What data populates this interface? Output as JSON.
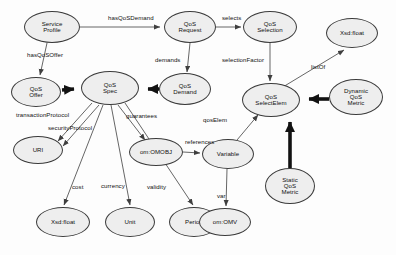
{
  "diagram": {
    "style": {
      "node_fill": "#eeeeee",
      "node_stroke": "#3a3a3a",
      "edge_color": "#555555",
      "bold_edge_color": "#111111",
      "background": "#fdfdfd"
    },
    "nodes": [
      {
        "id": "service-profile",
        "label": "Service\nProfile",
        "lines": [
          "Service",
          "Profile"
        ],
        "cx": 52,
        "cy": 27,
        "rx": 28,
        "ry": 16
      },
      {
        "id": "qos-request",
        "label": "QoS\nRequest",
        "lines": [
          "QoS",
          "Request"
        ],
        "cx": 190,
        "cy": 27,
        "rx": 26,
        "ry": 16
      },
      {
        "id": "qos-selection",
        "label": "QoS\nSelection",
        "lines": [
          "QoS",
          "Selection"
        ],
        "cx": 270,
        "cy": 27,
        "rx": 27,
        "ry": 16
      },
      {
        "id": "xsd-float-top",
        "label": "Xsd:float",
        "lines": [
          "Xsd:float"
        ],
        "cx": 352,
        "cy": 33,
        "rx": 26,
        "ry": 15
      },
      {
        "id": "qos-offer",
        "label": "QoS\nOffer",
        "lines": [
          "QoS",
          "Offer"
        ],
        "cx": 36,
        "cy": 92,
        "rx": 25,
        "ry": 15
      },
      {
        "id": "qos-spec",
        "label": "QoS\nSpec",
        "lines": [
          "QoS",
          "Spec"
        ],
        "cx": 110,
        "cy": 88,
        "rx": 29,
        "ry": 17
      },
      {
        "id": "qos-demand",
        "label": "QoS\nDemand",
        "lines": [
          "QoS",
          "Demand"
        ],
        "cx": 185,
        "cy": 89,
        "rx": 26,
        "ry": 16
      },
      {
        "id": "qos-selectelem",
        "label": "QoS\nSelectElem",
        "lines": [
          "QoS",
          "SelectElem"
        ],
        "cx": 271,
        "cy": 100,
        "rx": 29,
        "ry": 17
      },
      {
        "id": "dynamic-qos-metric",
        "label": "Dynamic\nQoS\nMetric",
        "lines": [
          "Dynamic",
          "QoS",
          "Metric"
        ],
        "cx": 356,
        "cy": 97,
        "rx": 27,
        "ry": 18
      },
      {
        "id": "uri",
        "label": "URI",
        "lines": [
          "URI"
        ],
        "cx": 38,
        "cy": 150,
        "rx": 25,
        "ry": 14
      },
      {
        "id": "om-omobj",
        "label": "om:OMOBJ",
        "lines": [
          "om:OMOBJ"
        ],
        "cx": 156,
        "cy": 152,
        "rx": 27,
        "ry": 14
      },
      {
        "id": "variable",
        "label": "Variable",
        "lines": [
          "Variable"
        ],
        "cx": 228,
        "cy": 154,
        "rx": 26,
        "ry": 15
      },
      {
        "id": "static-qos-metric",
        "label": "Static\nQoS\nMetric",
        "lines": [
          "Static",
          "QoS",
          "Metric"
        ],
        "cx": 290,
        "cy": 186,
        "rx": 25,
        "ry": 18
      },
      {
        "id": "xsd-float-bottom",
        "label": "Xsd:float",
        "lines": [
          "Xsd:float"
        ],
        "cx": 63,
        "cy": 222,
        "rx": 27,
        "ry": 15
      },
      {
        "id": "unit",
        "label": "Unit",
        "lines": [
          "Unit"
        ],
        "cx": 130,
        "cy": 222,
        "rx": 25,
        "ry": 15
      },
      {
        "id": "period",
        "label": "Period",
        "lines": [
          "Period"
        ],
        "cx": 194,
        "cy": 222,
        "rx": 25,
        "ry": 15
      },
      {
        "id": "om-omv",
        "label": "om:OMV",
        "lines": [
          "om:OMV"
        ],
        "cx": 225,
        "cy": 222,
        "rx": 26,
        "ry": 14
      }
    ],
    "edges": [
      {
        "id": "e-hasqosdemand",
        "from": "service-profile",
        "to": "qos-request",
        "label": "hasQoSDemand",
        "bold": false
      },
      {
        "id": "e-selects",
        "from": "qos-request",
        "to": "qos-selection",
        "label": "selects",
        "bold": false
      },
      {
        "id": "e-hasqosoffer",
        "from": "service-profile",
        "to": "qos-offer",
        "label": "hasQoSOffer",
        "bold": false
      },
      {
        "id": "e-demands",
        "from": "qos-request",
        "to": "qos-demand",
        "label": "demands",
        "bold": false
      },
      {
        "id": "e-offer-spec",
        "from": "qos-offer",
        "to": "qos-spec",
        "label": "",
        "bold": true
      },
      {
        "id": "e-demand-spec",
        "from": "qos-demand",
        "to": "qos-spec",
        "label": "",
        "bold": true
      },
      {
        "id": "e-selectionfactor",
        "from": "qos-selection",
        "to": "qos-selectelem",
        "label": "selectionFactor",
        "bold": false
      },
      {
        "id": "e-listof",
        "from": "qos-selectelem",
        "to": "xsd-float-top",
        "label": "listOf",
        "bold": false
      },
      {
        "id": "e-dynamic-select",
        "from": "dynamic-qos-metric",
        "to": "qos-selectelem",
        "label": "",
        "bold": true
      },
      {
        "id": "e-static-select",
        "from": "static-qos-metric",
        "to": "qos-selectelem",
        "label": "",
        "bold": true
      },
      {
        "id": "e-transactionprotocol",
        "from": "qos-spec",
        "to": "uri",
        "label": "transactionProtocol",
        "bold": false
      },
      {
        "id": "e-securityprotocol",
        "from": "qos-spec",
        "to": "uri",
        "label": "securityProtocol",
        "bold": false
      },
      {
        "id": "e-guarantees",
        "from": "qos-spec",
        "to": "om-omobj",
        "label": "guarantees",
        "bold": false
      },
      {
        "id": "e-cost",
        "from": "qos-spec",
        "to": "xsd-float-bottom",
        "label": "cost",
        "bold": false
      },
      {
        "id": "e-currency",
        "from": "qos-spec",
        "to": "unit",
        "label": "currency",
        "bold": false
      },
      {
        "id": "e-validity",
        "from": "qos-spec",
        "to": "period",
        "label": "validity",
        "bold": false
      },
      {
        "id": "e-references",
        "from": "om-omobj",
        "to": "variable",
        "label": "references",
        "bold": false
      },
      {
        "id": "e-qoselem",
        "from": "variable",
        "to": "qos-selectelem",
        "label": "qosElem",
        "bold": false
      },
      {
        "id": "e-var",
        "from": "variable",
        "to": "om-omv",
        "label": "var",
        "bold": false
      }
    ],
    "edge_labels": [
      {
        "id": "lbl-hasqosdemand",
        "text": "hasQoSDemand",
        "x": 108,
        "y": 20
      },
      {
        "id": "lbl-selects",
        "text": "selects",
        "x": 222,
        "y": 20
      },
      {
        "id": "lbl-hasqosoffer",
        "text": "hasQoSOffer",
        "x": 27,
        "y": 56
      },
      {
        "id": "lbl-demands",
        "text": "demands",
        "x": 155,
        "y": 61
      },
      {
        "id": "lbl-selectionfactor",
        "text": "selectionFactor",
        "x": 226,
        "y": 61
      },
      {
        "id": "lbl-listof",
        "text": "listOf",
        "x": 313,
        "y": 67
      },
      {
        "id": "lbl-transactionprotocol",
        "text": "transactionProtocol",
        "x": 18,
        "y": 115
      },
      {
        "id": "lbl-securityprotocol",
        "text": "securityProtocol",
        "x": 48,
        "y": 128
      },
      {
        "id": "lbl-guarantees",
        "text": "guarantees",
        "x": 128,
        "y": 116
      },
      {
        "id": "lbl-references",
        "text": "references",
        "x": 186,
        "y": 142
      },
      {
        "id": "lbl-qoselem",
        "text": "qosElem",
        "x": 205,
        "y": 120
      },
      {
        "id": "lbl-cost",
        "text": "cost",
        "x": 73,
        "y": 187
      },
      {
        "id": "lbl-currency",
        "text": "currency",
        "x": 103,
        "y": 186
      },
      {
        "id": "lbl-validity",
        "text": "validity",
        "x": 148,
        "y": 187
      },
      {
        "id": "lbl-var",
        "text": "var",
        "x": 219,
        "y": 196
      }
    ]
  }
}
